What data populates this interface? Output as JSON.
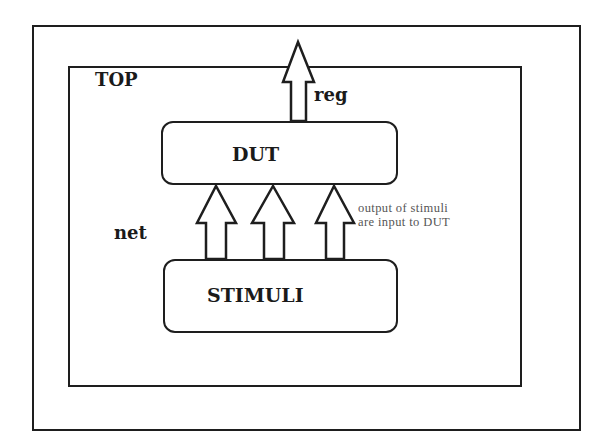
{
  "diagram": {
    "outer_box": {
      "label": ""
    },
    "top_module": {
      "label": "TOP"
    },
    "dut": {
      "label": "DUT"
    },
    "stimuli": {
      "label": "STIMULI"
    },
    "output_arrow": {
      "label": "reg"
    },
    "input_arrows": {
      "label": "net",
      "count": 3
    },
    "annotation": {
      "line1": "output of stimuli",
      "line2": "are input to DUT"
    }
  },
  "colors": {
    "stroke": "#1e1e1e",
    "annotation_text": "#555555",
    "background": "#ffffff"
  }
}
